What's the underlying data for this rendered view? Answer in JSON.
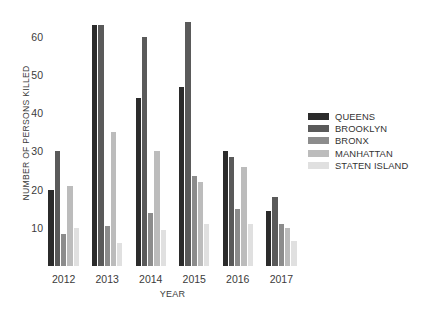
{
  "chart_data": {
    "type": "bar",
    "title": "",
    "xlabel": "YEAR",
    "ylabel": "NUMBER OF PERSONS KILLED",
    "categories": [
      "2012",
      "2013",
      "2014",
      "2015",
      "2016",
      "2017"
    ],
    "ylim": [
      0,
      66
    ],
    "yticks": [
      10,
      20,
      30,
      40,
      50,
      60
    ],
    "grid": false,
    "legend_position": "right",
    "series": [
      {
        "name": "QUEENS",
        "color": "#2b2b2b",
        "values": [
          20,
          63,
          44,
          47,
          30,
          14.5
        ]
      },
      {
        "name": "BROOKLYN",
        "color": "#5a5a5a",
        "values": [
          30,
          63,
          60,
          64,
          28.5,
          18
        ]
      },
      {
        "name": "BRONX",
        "color": "#8c8c8c",
        "values": [
          8.5,
          10.5,
          14,
          23.5,
          15,
          11
        ]
      },
      {
        "name": "MANHATTAN",
        "color": "#bcbcbc",
        "values": [
          21,
          35,
          30,
          22,
          26,
          10
        ]
      },
      {
        "name": "STATEN ISLAND",
        "color": "#e0e0e0",
        "values": [
          10,
          6,
          9.5,
          11,
          11,
          6.5
        ]
      }
    ]
  },
  "caption": {
    "text": ""
  }
}
